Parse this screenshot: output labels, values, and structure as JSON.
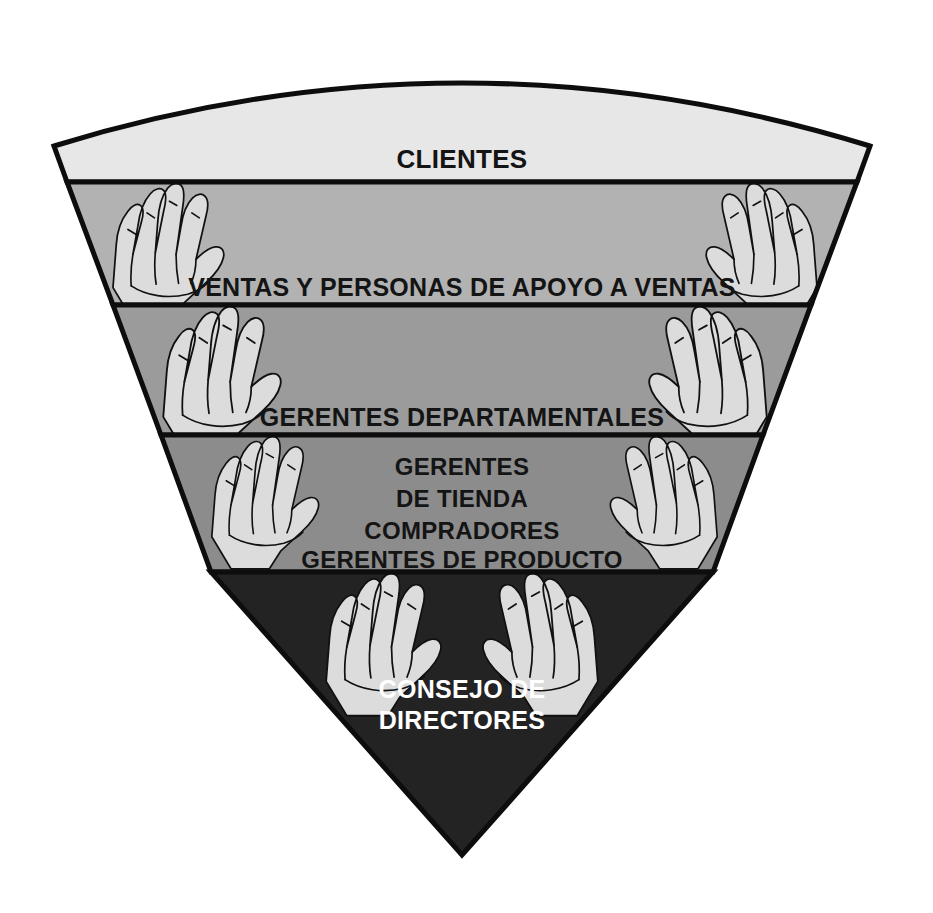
{
  "diagram": {
    "type": "inverted-pyramid-funnel",
    "shape": {
      "apex": {
        "x": 462,
        "y": 855
      },
      "top_arc_peak_y": 62,
      "top_left_x": 67,
      "top_right_x": 872
    },
    "background_color": "#ffffff",
    "outline_color": "#0d0d0d",
    "hand_fill_color": "#dcdcdc",
    "levels": [
      {
        "id": "clientes",
        "label": "CLIENTES",
        "lines": [
          "CLIENTES"
        ],
        "fill": "#e7e7e7",
        "text_color": "#141414",
        "font_size": 26,
        "has_hands": false,
        "top_y": 62,
        "bottom_y": 182
      },
      {
        "id": "ventas",
        "label": "VENTAS Y PERSONAS DE APOYO A VENTAS",
        "lines": [
          "VENTAS Y PERSONAS DE APOYO A VENTAS"
        ],
        "fill": "#b2b2b2",
        "text_color": "#141414",
        "font_size": 25,
        "has_hands": true,
        "hand_count": 2,
        "top_y": 182,
        "bottom_y": 305
      },
      {
        "id": "gerentes-departamentales",
        "label": "GERENTES DEPARTAMENTALES",
        "lines": [
          "GERENTES DEPARTAMENTALES"
        ],
        "fill": "#9b9b9b",
        "text_color": "#141414",
        "font_size": 25,
        "has_hands": true,
        "hand_count": 2,
        "top_y": 305,
        "bottom_y": 435
      },
      {
        "id": "gerentes-tienda",
        "label": "GERENTES DE TIENDA / COMPRADORES / GERENTES DE PRODUCTO",
        "lines": [
          "GERENTES",
          "DE TIENDA",
          "COMPRADORES",
          "GERENTES DE PRODUCTO"
        ],
        "fill": "#8c8c8c",
        "text_color": "#141414",
        "font_size": 24,
        "has_hands": true,
        "hand_count": 2,
        "top_y": 435,
        "bottom_y": 572
      },
      {
        "id": "consejo",
        "label": "CONSEJO DE DIRECTORES",
        "lines": [
          "CONSEJO DE",
          "DIRECTORES"
        ],
        "fill": "#232323",
        "text_color": "#ffffff",
        "font_size": 25,
        "has_hands": true,
        "hand_count": 2,
        "top_y": 572,
        "bottom_y": 855
      }
    ]
  }
}
